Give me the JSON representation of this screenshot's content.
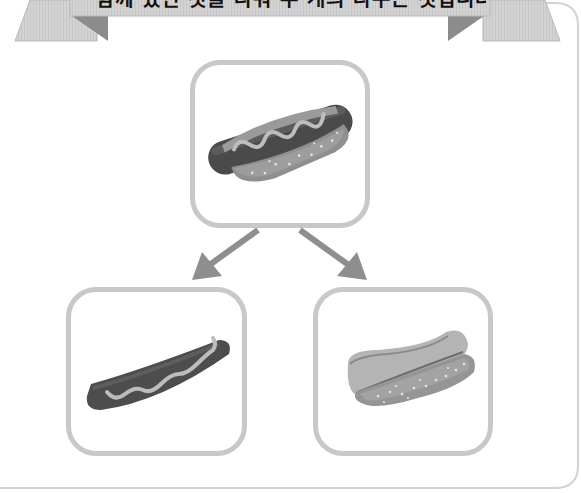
{
  "banner": {
    "title": "함께 있던 것을 나눠 두 개의 나누는 것입니다."
  },
  "colors": {
    "ribbon_face": "#d2d2d2",
    "ribbon_fold": "#8a8a8a",
    "ribbon_edge": "#b4b4b4",
    "card_border": "#c8c8c8",
    "arrow": "#8e8e8e",
    "frame": "#d0d0d0"
  },
  "diagram": {
    "top_card": {
      "label": "hotdog",
      "description": "Sausage in a bun with mustard"
    },
    "arrows": [
      {
        "from": "top_card",
        "to": "left_card"
      },
      {
        "from": "top_card",
        "to": "right_card"
      }
    ],
    "left_card": {
      "label": "sausage",
      "description": "Sausage with mustard"
    },
    "right_card": {
      "label": "bun",
      "description": "Hotdog bun"
    }
  }
}
